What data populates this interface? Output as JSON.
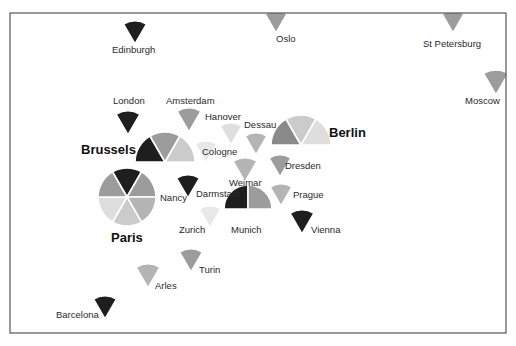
{
  "diagram": {
    "title": "",
    "frame": {
      "x": 10,
      "y": 13,
      "width": 496,
      "height": 320
    },
    "palette": {
      "dark": "#1e1e1e",
      "medium_dark": "#8a8a8a",
      "medium": "#9c9c9c",
      "medium_light": "#b4b4b4",
      "light": "#cbcbcb",
      "very_light": "#dedede",
      "lightest": "#e8e8e8"
    },
    "cities": [
      {
        "name": "Edinburgh",
        "major": false,
        "cx": 135,
        "cy": 44,
        "r": 23,
        "label": {
          "x": 112,
          "y": 53
        },
        "sectors": [
          {
            "start": -30,
            "end": 30,
            "shade": "dark"
          }
        ]
      },
      {
        "name": "Oslo",
        "major": false,
        "cx": 276,
        "cy": 33,
        "r": 22,
        "label": {
          "x": 276,
          "y": 42
        },
        "sectors": [
          {
            "start": -30,
            "end": 30,
            "shade": "medium"
          }
        ]
      },
      {
        "name": "St Petersburg",
        "major": false,
        "cx": 453,
        "cy": 33,
        "r": 22,
        "label": {
          "x": 423,
          "y": 47
        },
        "sectors": [
          {
            "start": -30,
            "end": 30,
            "shade": "medium"
          }
        ]
      },
      {
        "name": "Moscow",
        "major": false,
        "cx": 496,
        "cy": 95,
        "r": 25,
        "label": {
          "x": 465,
          "y": 104
        },
        "sectors": [
          {
            "start": -30,
            "end": 30,
            "shade": "medium"
          }
        ]
      },
      {
        "name": "London",
        "major": false,
        "cx": 128,
        "cy": 135,
        "r": 24,
        "label": {
          "x": 113,
          "y": 104
        },
        "sectors": [
          {
            "start": -30,
            "end": 30,
            "shade": "dark"
          }
        ]
      },
      {
        "name": "Amsterdam",
        "major": false,
        "cx": 189,
        "cy": 132,
        "r": 24,
        "label": {
          "x": 166,
          "y": 104
        },
        "sectors": [
          {
            "start": -30,
            "end": 30,
            "shade": "medium"
          }
        ]
      },
      {
        "name": "Hanover",
        "major": false,
        "cx": 231,
        "cy": 145,
        "r": 22,
        "label": {
          "x": 205,
          "y": 120
        },
        "sectors": [
          {
            "start": -30,
            "end": 30,
            "shade": "very_light"
          }
        ]
      },
      {
        "name": "Dessau",
        "major": false,
        "cx": 256,
        "cy": 155,
        "r": 22,
        "label": {
          "x": 244,
          "y": 128
        },
        "sectors": [
          {
            "start": -30,
            "end": 30,
            "shade": "medium_light"
          }
        ]
      },
      {
        "name": "Brussels",
        "major": true,
        "cx": 165,
        "cy": 162,
        "r": 30,
        "label": {
          "x": 81,
          "y": 154
        },
        "sectors": [
          {
            "start": -90,
            "end": -30,
            "shade": "dark"
          },
          {
            "start": -30,
            "end": 30,
            "shade": "medium"
          },
          {
            "start": 30,
            "end": 90,
            "shade": "light"
          }
        ]
      },
      {
        "name": "Cologne",
        "major": false,
        "cx": 206,
        "cy": 163,
        "r": 22,
        "label": {
          "x": 202,
          "y": 155
        },
        "sectors": [
          {
            "start": -30,
            "end": 30,
            "shade": "lightest"
          }
        ]
      },
      {
        "name": "Berlin",
        "major": true,
        "cx": 301,
        "cy": 145,
        "r": 30,
        "label": {
          "x": 329,
          "y": 137
        },
        "sectors": [
          {
            "start": -90,
            "end": -30,
            "shade": "medium_dark"
          },
          {
            "start": -30,
            "end": 30,
            "shade": "light"
          },
          {
            "start": 30,
            "end": 90,
            "shade": "very_light"
          }
        ]
      },
      {
        "name": "Dresden",
        "major": false,
        "cx": 280,
        "cy": 177,
        "r": 22,
        "label": {
          "x": 285,
          "y": 169
        },
        "sectors": [
          {
            "start": -30,
            "end": 30,
            "shade": "medium"
          }
        ]
      },
      {
        "name": "Weimar",
        "major": false,
        "cx": 245,
        "cy": 182,
        "r": 24,
        "label": {
          "x": 229,
          "y": 186
        },
        "sectors": [
          {
            "start": -30,
            "end": 30,
            "shade": "medium_light"
          }
        ]
      },
      {
        "name": "Darmstadt",
        "major": false,
        "cx": 188,
        "cy": 198,
        "r": 23,
        "label": {
          "x": 196,
          "y": 197
        },
        "sectors": [
          {
            "start": -30,
            "end": 30,
            "shade": "dark"
          }
        ]
      },
      {
        "name": "Paris",
        "major": true,
        "cx": 127,
        "cy": 197,
        "r": 29,
        "label": {
          "x": 111,
          "y": 242
        },
        "sectors": [
          {
            "start": -30,
            "end": 30,
            "shade": "dark"
          },
          {
            "start": 30,
            "end": 90,
            "shade": "medium"
          },
          {
            "start": 90,
            "end": 150,
            "shade": "medium_light"
          },
          {
            "start": 150,
            "end": 210,
            "shade": "light"
          },
          {
            "start": 210,
            "end": 270,
            "shade": "very_light"
          },
          {
            "start": 270,
            "end": 330,
            "shade": "medium"
          }
        ]
      },
      {
        "name": "Nancy",
        "major": false,
        "cx": 0,
        "cy": 0,
        "r": 0,
        "label": {
          "x": 160,
          "y": 201
        },
        "sectors": []
      },
      {
        "name": "Prague",
        "major": false,
        "cx": 281,
        "cy": 206,
        "r": 22,
        "label": {
          "x": 293,
          "y": 198
        },
        "sectors": [
          {
            "start": -30,
            "end": 30,
            "shade": "medium_light"
          }
        ]
      },
      {
        "name": "Zurich",
        "major": false,
        "cx": 210,
        "cy": 228,
        "r": 22,
        "label": {
          "x": 179,
          "y": 233
        },
        "sectors": [
          {
            "start": -30,
            "end": 30,
            "shade": "lightest"
          }
        ]
      },
      {
        "name": "Munich",
        "major": false,
        "cx": 248,
        "cy": 209,
        "r": 24,
        "label": {
          "x": 231,
          "y": 233
        },
        "sectors": [
          {
            "start": -90,
            "end": 0,
            "shade": "dark"
          },
          {
            "start": 0,
            "end": 90,
            "shade": "medium"
          }
        ]
      },
      {
        "name": "Vienna",
        "major": false,
        "cx": 302,
        "cy": 234,
        "r": 24,
        "label": {
          "x": 311,
          "y": 233
        },
        "sectors": [
          {
            "start": -30,
            "end": 30,
            "shade": "dark"
          }
        ]
      },
      {
        "name": "Turin",
        "major": false,
        "cx": 191,
        "cy": 272,
        "r": 23,
        "label": {
          "x": 199,
          "y": 273
        },
        "sectors": [
          {
            "start": -30,
            "end": 30,
            "shade": "medium"
          }
        ]
      },
      {
        "name": "Arles",
        "major": false,
        "cx": 148,
        "cy": 288,
        "r": 24,
        "label": {
          "x": 155,
          "y": 289
        },
        "sectors": [
          {
            "start": -30,
            "end": 30,
            "shade": "medium_light"
          }
        ]
      },
      {
        "name": "Barcelona",
        "major": false,
        "cx": 105,
        "cy": 319,
        "r": 23,
        "label": {
          "x": 56,
          "y": 318
        },
        "sectors": [
          {
            "start": -30,
            "end": 30,
            "shade": "dark"
          }
        ]
      }
    ]
  }
}
